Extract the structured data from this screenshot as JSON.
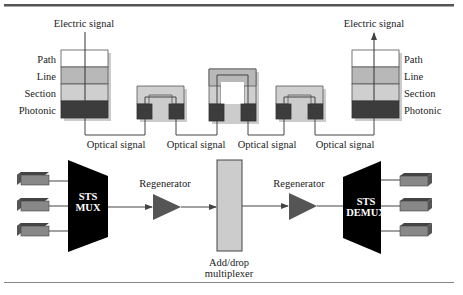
{
  "colors": {
    "rule": "#555555",
    "path_layer": "#ffffff",
    "line_layer": "#b8b8b8",
    "section_layer": "#cfcfcf",
    "photonic_layer": "#3c3c3c",
    "regenerator": "#555555",
    "mux": "#000000",
    "adm": "#cccccc",
    "terminal": "#888888",
    "wire": "#444444"
  },
  "top_diagram": {
    "left_stack": {
      "signal_label": "Electric signal",
      "layers": [
        "Path",
        "Line",
        "Section",
        "Photonic"
      ]
    },
    "right_stack": {
      "signal_label": "Electric signal",
      "layers": [
        "Path",
        "Line",
        "Section",
        "Photonic"
      ]
    },
    "optical_labels": [
      "Optical signal",
      "Optical signal",
      "Optical signal",
      "Optical signal"
    ]
  },
  "bottom_diagram": {
    "mux_label_line1": "STS",
    "mux_label_line2": "MUX",
    "regenerator_left": "Regenerator",
    "adm_label_line1": "Add/drop",
    "adm_label_line2": "multiplexer",
    "regenerator_right": "Regenerator",
    "demux_label_line1": "STS",
    "demux_label_line2": "DEMUX"
  }
}
